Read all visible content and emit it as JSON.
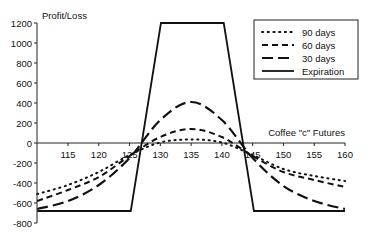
{
  "chart_data": {
    "type": "line",
    "title": "",
    "xlabel": "Coffee \"c\" Futures",
    "ylabel": "Profit/Loss",
    "xlim": [
      110,
      160
    ],
    "ylim": [
      -800,
      1200
    ],
    "x_ticks": [
      115,
      120,
      125,
      130,
      135,
      140,
      145,
      150,
      155,
      160
    ],
    "y_ticks": [
      1200,
      1000,
      800,
      600,
      400,
      200,
      0,
      -200,
      -400,
      -600,
      -800
    ],
    "grid": false,
    "legend_position": "upper right",
    "series": [
      {
        "name": "90 days",
        "style": "dotted",
        "x": [
          110,
          115,
          120,
          125,
          130,
          135,
          140,
          145,
          150,
          155,
          160
        ],
        "y": [
          -510,
          -420,
          -290,
          -120,
          5,
          35,
          5,
          -120,
          -260,
          -330,
          -380
        ]
      },
      {
        "name": "60 days",
        "style": "dashed",
        "x": [
          110,
          115,
          120,
          125,
          130,
          135,
          140,
          145,
          150,
          155,
          160
        ],
        "y": [
          -580,
          -470,
          -340,
          -130,
          60,
          140,
          60,
          -130,
          -290,
          -370,
          -440
        ]
      },
      {
        "name": "30 days",
        "style": "long-dashed",
        "x": [
          110,
          115,
          120,
          125,
          130,
          135,
          140,
          145,
          150,
          155,
          160
        ],
        "y": [
          -660,
          -580,
          -420,
          -150,
          230,
          410,
          230,
          -150,
          -430,
          -580,
          -660
        ]
      },
      {
        "name": "Expiration",
        "style": "solid",
        "x": [
          110,
          125.2,
          130.1,
          140.3,
          145.2,
          160
        ],
        "y": [
          -680,
          -680,
          1200,
          1200,
          -680,
          -680
        ]
      }
    ]
  },
  "legend": {
    "items": [
      {
        "label": "90 days"
      },
      {
        "label": "60 days"
      },
      {
        "label": "30 days"
      },
      {
        "label": "Expiration"
      }
    ]
  },
  "axes": {
    "y_title": "Profit/Loss",
    "x_title": "Coffee \"c\" Futures"
  }
}
